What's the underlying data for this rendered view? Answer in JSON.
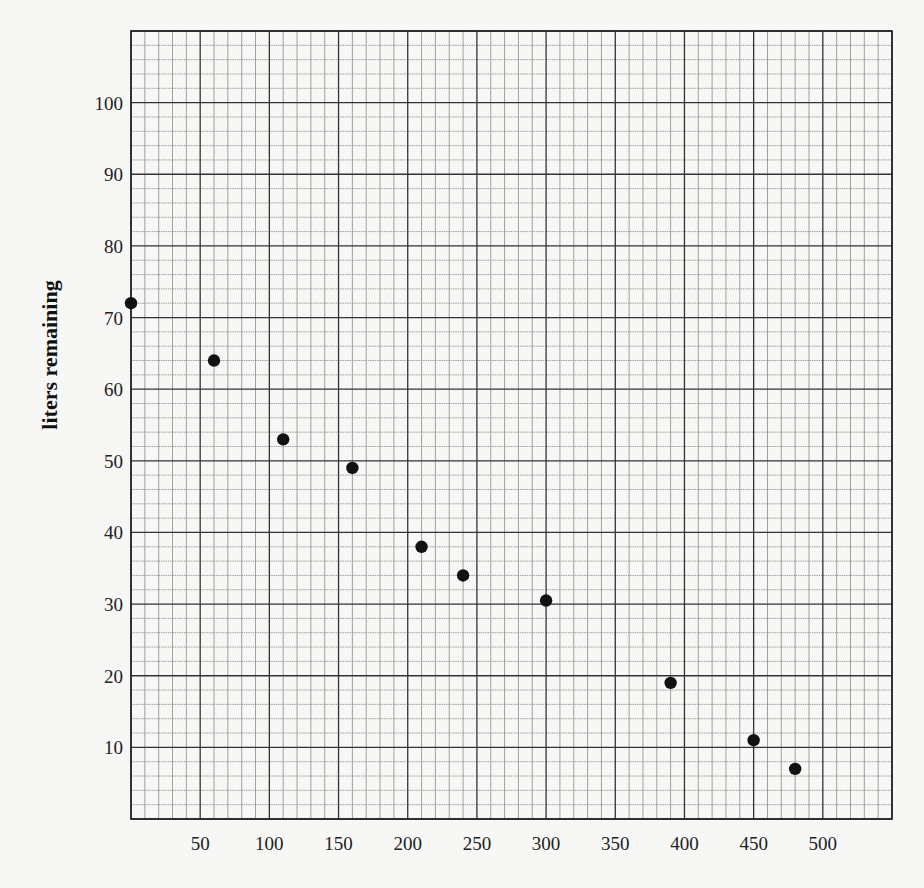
{
  "chart_data": {
    "type": "scatter",
    "title": "",
    "xlabel": "",
    "ylabel": "liters remaining",
    "xlim": [
      0,
      550
    ],
    "ylim": [
      0,
      110
    ],
    "x_ticks": [
      50,
      100,
      150,
      200,
      250,
      300,
      350,
      400,
      450,
      500
    ],
    "y_ticks": [
      10,
      20,
      30,
      40,
      50,
      60,
      70,
      80,
      90,
      100
    ],
    "grid": {
      "on": true,
      "x_minor_step": 10,
      "x_major_step": 50,
      "y_minor_step": 2,
      "y_major_step": 10
    },
    "legend": null,
    "series": [
      {
        "name": "data",
        "marker": "filled-circle",
        "color": "#111111",
        "points": [
          {
            "x": 0,
            "y": 72
          },
          {
            "x": 60,
            "y": 64
          },
          {
            "x": 110,
            "y": 53
          },
          {
            "x": 160,
            "y": 49
          },
          {
            "x": 210,
            "y": 38
          },
          {
            "x": 240,
            "y": 34
          },
          {
            "x": 300,
            "y": 30.5
          },
          {
            "x": 390,
            "y": 19
          },
          {
            "x": 450,
            "y": 11
          },
          {
            "x": 480,
            "y": 7
          }
        ]
      }
    ]
  },
  "colors": {
    "background": "#f7f7f5",
    "grid_minor": "#8a8a8a",
    "grid_major": "#333333",
    "marker": "#111111"
  }
}
